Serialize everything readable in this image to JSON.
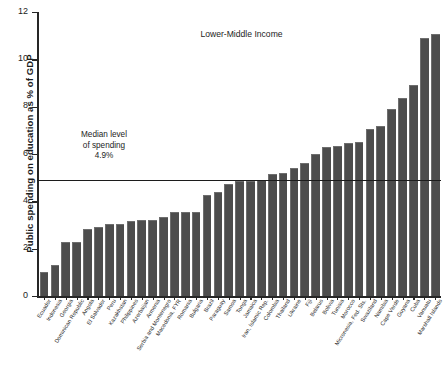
{
  "chart_data": {
    "type": "bar",
    "title": "Lower-Middle Income",
    "xlabel": "",
    "ylabel": "Public spending on education as % of GDP",
    "ylim": [
      0,
      12
    ],
    "yticks": [
      0,
      2,
      4,
      6,
      8,
      10,
      12
    ],
    "grid": false,
    "legend": "none",
    "bar_color": "#4d4d4d",
    "annotations": {
      "median_line_value": 4.9,
      "median_note_line1": "Median level",
      "median_note_line2": "of spending",
      "median_note_line3": "4.9%"
    },
    "categories": [
      "Ecuador",
      "Indonesia",
      "Georgia",
      "Dominican Republic",
      "Angola",
      "El Salvador",
      "Peru",
      "Kazakhstan",
      "Philippines",
      "Azerbaijan",
      "Armenia",
      "Serbia and Montenegro",
      "Macedonia, FYR",
      "Romania",
      "Bulgaria",
      "Brazil",
      "Paraguay",
      "Samoa",
      "Tonga",
      "Jamaica",
      "Iran, Islamic Rep.",
      "Colombia",
      "Thailand",
      "Ukraine",
      "Fiji",
      "Belarus",
      "Bolivia",
      "Tunisia",
      "Morocco",
      "Micronesia, Fed. Sts.",
      "Swaziland",
      "Namibia",
      "Cape Verde",
      "Guyana",
      "Cuba",
      "Vanuatu",
      "Marshall Islands"
    ],
    "values": [
      1.0,
      1.3,
      2.3,
      2.3,
      2.85,
      2.9,
      3.05,
      3.05,
      3.15,
      3.2,
      3.2,
      3.35,
      3.55,
      3.55,
      3.55,
      4.25,
      4.4,
      4.75,
      4.85,
      4.85,
      4.9,
      5.15,
      5.2,
      5.4,
      5.6,
      6.0,
      6.3,
      6.35,
      6.45,
      6.5,
      7.05,
      7.2,
      7.9,
      8.35,
      8.9,
      10.9,
      11.05
    ]
  },
  "bleed_text": ""
}
